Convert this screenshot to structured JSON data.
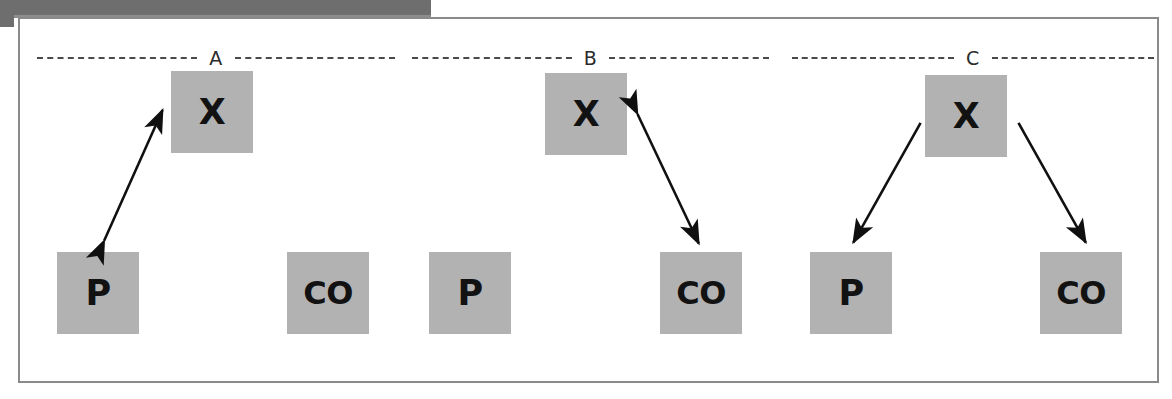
{
  "figure": {
    "type": "diagram",
    "caption_label_style": "panel letters",
    "background_color": "#ffffff",
    "frame_color": "#8a8a8a",
    "node_fill_color": "#b2b2b2",
    "node_text_color": "#121212",
    "arrow_color": "#101010",
    "scan_edge_color": "#6e6e6e",
    "panels": [
      {
        "id": "panel-a",
        "label": "A",
        "nodes": [
          {
            "id": "a-x",
            "label": "X",
            "x": 151,
            "y": 69,
            "role": "latent-variable"
          },
          {
            "id": "a-p",
            "label": "P",
            "x": 37,
            "y": 250,
            "role": "predictor"
          },
          {
            "id": "a-co",
            "label": "CO",
            "x": 267,
            "y": 250,
            "role": "outcome"
          }
        ],
        "edges": [
          {
            "from": "a-p",
            "to": "a-x",
            "arrowheads": "both",
            "style": "solid"
          }
        ]
      },
      {
        "id": "panel-b",
        "label": "B",
        "nodes": [
          {
            "id": "b-x",
            "label": "X",
            "x": 525,
            "y": 71,
            "role": "latent-variable"
          },
          {
            "id": "b-p",
            "label": "P",
            "x": 409,
            "y": 250,
            "role": "predictor"
          },
          {
            "id": "b-co",
            "label": "CO",
            "x": 640,
            "y": 250,
            "role": "outcome"
          }
        ],
        "edges": [
          {
            "from": "b-x",
            "to": "b-co",
            "arrowheads": "both",
            "style": "solid"
          }
        ]
      },
      {
        "id": "panel-c",
        "label": "C",
        "nodes": [
          {
            "id": "c-x",
            "label": "X",
            "x": 905,
            "y": 73,
            "role": "latent-variable"
          },
          {
            "id": "c-p",
            "label": "P",
            "x": 790,
            "y": 250,
            "role": "predictor"
          },
          {
            "id": "c-co",
            "label": "CO",
            "x": 1020,
            "y": 250,
            "role": "outcome"
          }
        ],
        "edges": [
          {
            "from": "c-x",
            "to": "c-p",
            "arrowheads": "end",
            "style": "solid"
          },
          {
            "from": "c-x",
            "to": "c-co",
            "arrowheads": "end",
            "style": "solid"
          }
        ]
      }
    ]
  }
}
